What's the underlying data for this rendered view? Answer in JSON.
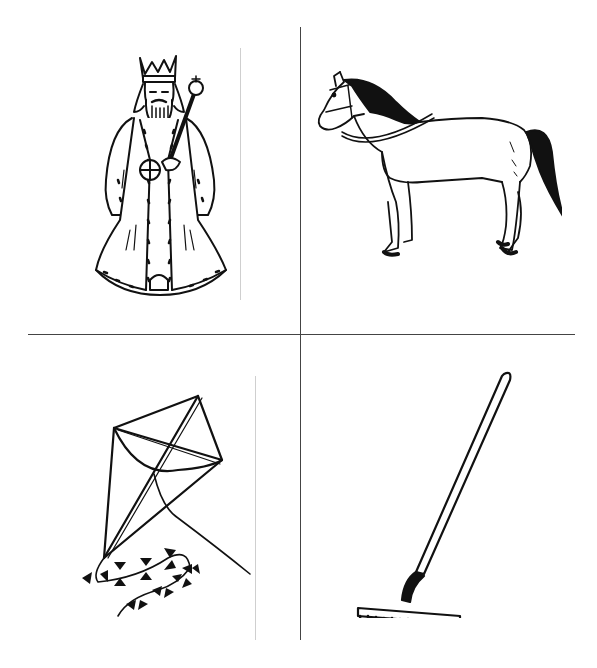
{
  "grid": {
    "rows": 2,
    "cols": 2,
    "divider_color": "#444444",
    "background": "#ffffff"
  },
  "cells": [
    {
      "position": "top-left",
      "subject": "king",
      "icon": "king-drawing"
    },
    {
      "position": "top-right",
      "subject": "horse",
      "icon": "horse-drawing"
    },
    {
      "position": "bottom-left",
      "subject": "kite",
      "icon": "kite-drawing"
    },
    {
      "position": "bottom-right",
      "subject": "rake",
      "icon": "rake-drawing"
    }
  ]
}
